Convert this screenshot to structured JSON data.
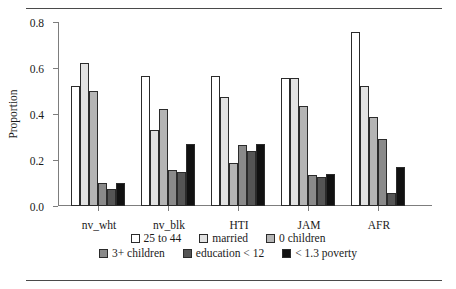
{
  "chart_data": {
    "type": "bar",
    "title": "",
    "xlabel": "",
    "ylabel": "Proportion",
    "ylim": [
      0.0,
      0.8
    ],
    "yticks": [
      "0.0",
      "0.2",
      "0.4",
      "0.6",
      "0.8"
    ],
    "ytick_values": [
      0.0,
      0.2,
      0.4,
      0.6,
      0.8
    ],
    "grid": false,
    "legend_position": "bottom",
    "categories": [
      "nv_wht",
      "nv_blk",
      "HTI",
      "JAM",
      "AFR"
    ],
    "series": [
      {
        "name": "25 to 44",
        "color": "#ffffff",
        "values": [
          0.52,
          0.565,
          0.565,
          0.555,
          0.755
        ]
      },
      {
        "name": "married",
        "color": "#e2e2e2",
        "values": [
          0.62,
          0.33,
          0.475,
          0.555,
          0.52
        ]
      },
      {
        "name": "0 children",
        "color": "#b5b5b5",
        "values": [
          0.5,
          0.42,
          0.185,
          0.435,
          0.385
        ]
      },
      {
        "name": "3+ children",
        "color": "#8a8a8a",
        "values": [
          0.1,
          0.155,
          0.265,
          0.135,
          0.29
        ]
      },
      {
        "name": "education < 12",
        "color": "#555555",
        "values": [
          0.075,
          0.15,
          0.24,
          0.125,
          0.055
        ]
      },
      {
        "name": "< 1.3 poverty",
        "color": "#111111",
        "values": [
          0.1,
          0.27,
          0.27,
          0.14,
          0.17
        ]
      }
    ]
  },
  "legend": {
    "rows": [
      [
        "25 to 44",
        "married",
        "0 children"
      ],
      [
        "3+ children",
        "education < 12",
        "< 1.3 poverty"
      ]
    ]
  }
}
